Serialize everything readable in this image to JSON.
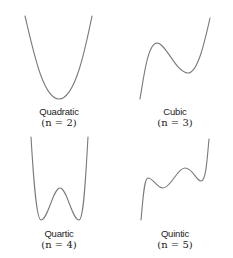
{
  "figure": {
    "panels": [
      {
        "id": "quadratic",
        "name": "Quadratic",
        "degree_label": "(n = 2)",
        "degree": 2,
        "shape": "U-shaped parabola with single minimum"
      },
      {
        "id": "cubic",
        "name": "Cubic",
        "degree_label": "(n = 3)",
        "degree": 3,
        "shape": "rising curve with one local max and one local min"
      },
      {
        "id": "quartic",
        "name": "Quartic",
        "degree_label": "(n = 4)",
        "degree": 4,
        "shape": "W-shaped curve with two minima and one central max"
      },
      {
        "id": "quintic",
        "name": "Quintic",
        "degree_label": "(n = 5)",
        "degree": 5,
        "shape": "rising curve with two local maxima and two local minima"
      }
    ],
    "curve_color": "#7a7a7a",
    "background": "#ffffff"
  }
}
